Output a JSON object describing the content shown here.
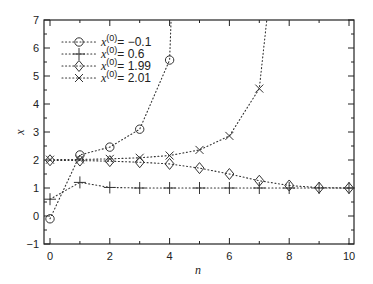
{
  "chart_data": {
    "type": "line",
    "title": "",
    "xlabel": "n",
    "ylabel": "x",
    "xlim": [
      -0.3,
      10.2
    ],
    "ylim": [
      -1,
      7
    ],
    "xticks": [
      0,
      2,
      4,
      6,
      8,
      10
    ],
    "yticks": [
      -1,
      0,
      1,
      2,
      3,
      4,
      5,
      6,
      7
    ],
    "grid": false,
    "legend_position": "upper left",
    "line_style": "dotted",
    "x": [
      0,
      1,
      2,
      3,
      4,
      5,
      6,
      7,
      8,
      9,
      10
    ],
    "series": [
      {
        "name": "x(0) = -0.1",
        "marker": "circle",
        "values": [
          -0.1,
          2.18,
          2.46,
          3.1,
          5.57,
          null,
          null,
          null,
          null,
          null,
          null
        ],
        "continues_to_top_at_x": 4.05
      },
      {
        "name": "x(0) = 0.6",
        "marker": "plus",
        "values": [
          0.6,
          1.2,
          1.02,
          1.0,
          1.0,
          1.0,
          1.0,
          1.0,
          1.0,
          1.0,
          1.0
        ]
      },
      {
        "name": "x(0) = 1.99",
        "marker": "diamond",
        "values": [
          1.99,
          1.98,
          1.96,
          1.92,
          1.86,
          1.71,
          1.5,
          1.26,
          1.09,
          1.01,
          1.0
        ]
      },
      {
        "name": "x(0) = 2.01",
        "marker": "cross",
        "values": [
          2.01,
          2.02,
          2.04,
          2.08,
          2.16,
          2.36,
          2.86,
          4.55,
          null,
          null,
          null
        ],
        "continues_to_top_at_x": 7.25
      }
    ]
  },
  "legend": {
    "items": [
      {
        "var": "x",
        "sup": "(0)",
        "eq": "= −0.1",
        "marker": "circle"
      },
      {
        "var": "x",
        "sup": "(0)",
        "eq": "=  0.6",
        "marker": "plus"
      },
      {
        "var": "x",
        "sup": "(0)",
        "eq": "= 1.99",
        "marker": "diamond"
      },
      {
        "var": "x",
        "sup": "(0)",
        "eq": "= 2.01",
        "marker": "cross"
      }
    ]
  },
  "axes": {
    "xlabel": "n",
    "ylabel": "x",
    "xtick_labels": [
      "0",
      "2",
      "4",
      "6",
      "8",
      "10"
    ],
    "ytick_labels": [
      "−1",
      "0",
      "1",
      "2",
      "3",
      "4",
      "5",
      "6",
      "7"
    ]
  },
  "colors": {
    "line": "#333333",
    "axis": "#222222",
    "background": "#ffffff"
  }
}
